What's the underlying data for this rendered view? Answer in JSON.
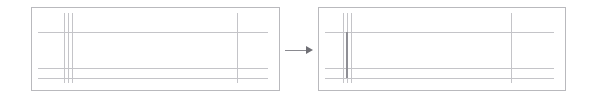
{
  "figure": {
    "title": "",
    "caption": "",
    "background_color": "#ffffff",
    "width": 591,
    "height": 100
  },
  "colors": {
    "panel_border": "#b9b9bd",
    "trace_line": "#c4c4c8",
    "emphasis_line": "#8f8f95",
    "arrow": "#8a8a90",
    "arrow_head": "#6f6f75",
    "background": "#ffffff"
  },
  "panels": [
    {
      "name": "before-panel",
      "label": "",
      "x": 31,
      "y": 7,
      "width": 249,
      "height": 84,
      "horizontal_lines": [
        {
          "name": "hline-upper",
          "y": 25,
          "x_start": 7,
          "x_end": 237,
          "emphasis": false
        },
        {
          "name": "hline-middle",
          "y": 61,
          "x_start": 7,
          "x_end": 237,
          "emphasis": false
        },
        {
          "name": "hline-lower",
          "y": 71,
          "x_start": 7,
          "x_end": 237,
          "emphasis": false
        }
      ],
      "vertical_lines": [
        {
          "name": "vline-cluster-a",
          "x": 33,
          "y_start": 6,
          "y_end": 76,
          "emphasis": false
        },
        {
          "name": "vline-cluster-b",
          "x": 37,
          "y_start": 6,
          "y_end": 76,
          "emphasis": false
        },
        {
          "name": "vline-cluster-c",
          "x": 41,
          "y_start": 6,
          "y_end": 76,
          "emphasis": false
        },
        {
          "name": "vline-right",
          "x": 206,
          "y_start": 6,
          "y_end": 76,
          "emphasis": false
        }
      ]
    },
    {
      "name": "after-panel",
      "label": "",
      "x": 318,
      "y": 7,
      "width": 248,
      "height": 84,
      "horizontal_lines": [
        {
          "name": "hline-upper",
          "y": 25,
          "x_start": 7,
          "x_end": 236,
          "emphasis": false
        },
        {
          "name": "hline-middle",
          "y": 61,
          "x_start": 7,
          "x_end": 236,
          "emphasis": false
        },
        {
          "name": "hline-lower",
          "y": 71,
          "x_start": 7,
          "x_end": 236,
          "emphasis": false
        }
      ],
      "vertical_lines": [
        {
          "name": "vline-cluster-a",
          "x": 25,
          "y_start": 6,
          "y_end": 76,
          "emphasis": false
        },
        {
          "name": "vline-cluster-b",
          "x": 29,
          "y_start": 6,
          "y_end": 76,
          "emphasis": false
        },
        {
          "name": "vline-cluster-c",
          "x": 33,
          "y_start": 6,
          "y_end": 76,
          "emphasis": false
        },
        {
          "name": "vline-emphasis",
          "x": 28,
          "y_start": 25,
          "y_end": 71,
          "emphasis": true
        },
        {
          "name": "vline-right",
          "x": 193,
          "y_start": 6,
          "y_end": 76,
          "emphasis": false
        }
      ]
    }
  ],
  "arrow": {
    "name": "flow-arrow",
    "direction": "right",
    "label": "",
    "x": 285,
    "y": 44,
    "width": 29,
    "height": 12,
    "shaft_length": 22,
    "head_size": 7
  }
}
